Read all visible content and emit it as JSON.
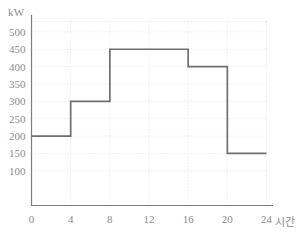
{
  "chart_data": {
    "type": "line",
    "subtype": "step-post",
    "title": "",
    "subtitle": "",
    "xlabel": "시간",
    "ylabel": "kW",
    "xlim": [
      0,
      24
    ],
    "ylim": [
      0,
      530
    ],
    "x_ticks": [
      0,
      4,
      8,
      12,
      16,
      20,
      24
    ],
    "x_tick_labels": [
      "0",
      "4",
      "8",
      "12",
      "16",
      "20",
      "24"
    ],
    "y_ticks": [
      100,
      150,
      200,
      250,
      300,
      350,
      400,
      450,
      500
    ],
    "y_tick_labels": [
      "100",
      "150",
      "200",
      "250",
      "300",
      "350",
      "400",
      "450",
      "500"
    ],
    "grid": true,
    "grid_style": "dotted",
    "legend": "none",
    "series": [
      {
        "name": "kW",
        "step_segments": [
          {
            "x_start": 0,
            "x_end": 4,
            "value": 200
          },
          {
            "x_start": 4,
            "x_end": 8,
            "value": 300
          },
          {
            "x_start": 8,
            "x_end": 16,
            "value": 450
          },
          {
            "x_start": 16,
            "x_end": 20,
            "value": 400
          },
          {
            "x_start": 20,
            "x_end": 24,
            "value": 150
          }
        ],
        "x": [
          0,
          4,
          4,
          8,
          8,
          16,
          16,
          20,
          20,
          24
        ],
        "values": [
          200,
          200,
          300,
          300,
          450,
          450,
          400,
          400,
          150,
          150
        ]
      }
    ]
  },
  "colors": {
    "step_line": "#6f6f6f",
    "axis": "#7d7d7d",
    "grid": "#d9d9d9",
    "text": "#8c8c8c",
    "background": "#ffffff"
  }
}
